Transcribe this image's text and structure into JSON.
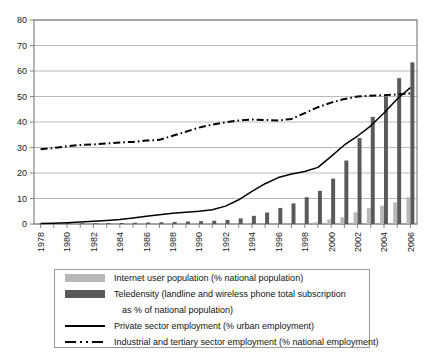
{
  "chart_data": {
    "type": "bar",
    "title": "",
    "subtitle": "",
    "xlabel": "",
    "ylabel": "",
    "ylim": [
      0,
      80
    ],
    "ytick_step": 10,
    "yticks": [
      0,
      10,
      20,
      30,
      40,
      50,
      60,
      70,
      80
    ],
    "grid": true,
    "legend_position": "below-plot",
    "x": [
      1978,
      1979,
      1980,
      1981,
      1982,
      1983,
      1984,
      1985,
      1986,
      1987,
      1988,
      1989,
      1990,
      1991,
      1992,
      1993,
      1994,
      1995,
      1996,
      1997,
      1998,
      1999,
      2000,
      2001,
      2002,
      2003,
      2004,
      2005,
      2006
    ],
    "xtick_labels": [
      "1978",
      "1980",
      "1982",
      "1984",
      "1986",
      "1988",
      "1990",
      "1992",
      "1994",
      "1996",
      "1998",
      "2000",
      "2002",
      "2004",
      "2006"
    ],
    "series": [
      {
        "name": "Internet user population (% national population)",
        "type": "bar",
        "color": "#b8b8b8",
        "values": [
          0,
          0,
          0,
          0,
          0,
          0,
          0,
          0,
          0,
          0,
          0,
          0,
          0,
          0,
          0,
          0,
          0,
          0,
          0,
          0,
          0.1,
          0.7,
          1.8,
          2.6,
          4.6,
          6.2,
          7.2,
          8.5,
          10.5
        ]
      },
      {
        "name": "Teledensity (landline and wireless phone total subscription as % of national population)",
        "type": "bar",
        "color": "#5a5a5a",
        "values": [
          0.2,
          0.2,
          0.3,
          0.3,
          0.3,
          0.4,
          0.4,
          0.5,
          0.6,
          0.7,
          0.8,
          1.0,
          1.1,
          1.3,
          1.6,
          2.2,
          3.2,
          4.5,
          6.3,
          8.1,
          10.5,
          13.0,
          17.8,
          24.9,
          33.7,
          42.0,
          50.0,
          57.2,
          63.4
        ]
      },
      {
        "name": "Private sector employment (% urban employment)",
        "type": "line",
        "style": "solid",
        "color": "#000000",
        "values": [
          0.2,
          0.3,
          0.5,
          0.8,
          1.1,
          1.4,
          1.8,
          2.4,
          3.0,
          3.6,
          4.2,
          4.6,
          5.0,
          5.6,
          7.0,
          9.5,
          12.8,
          15.8,
          18.2,
          19.6,
          20.6,
          22.2,
          26.5,
          31.0,
          34.5,
          38.5,
          43.5,
          49.0,
          53.5
        ]
      },
      {
        "name": "Industrial and tertiary sector employment (% national employment)",
        "type": "line",
        "style": "dash-dot",
        "color": "#000000",
        "values": [
          29.3,
          29.8,
          30.5,
          31.0,
          31.2,
          31.6,
          32.0,
          32.2,
          32.7,
          33.0,
          34.6,
          36.2,
          37.8,
          39.0,
          39.9,
          40.6,
          41.0,
          40.8,
          40.6,
          41.2,
          43.5,
          45.8,
          47.6,
          49.0,
          50.0,
          50.3,
          50.5,
          50.8,
          51.2
        ]
      }
    ]
  },
  "legend": {
    "rows": [
      {
        "key": "swatch-light",
        "label": "Internet user population (% national population)"
      },
      {
        "key": "swatch-dark",
        "label": "Teledensity (landline and wireless phone total subscription"
      },
      {
        "key": "none",
        "label": "as % of national population)"
      },
      {
        "key": "line-solid",
        "label": "Private sector employment (% urban employment)"
      },
      {
        "key": "line-dashdot",
        "label": "Industrial and tertiary sector employment (% national employment)"
      }
    ]
  },
  "colors": {
    "internet_bar": "#b8b8b8",
    "teledensity_bar": "#5a5a5a",
    "line": "#000000",
    "grid": "#aaaaaa",
    "axis": "#777777",
    "legend_border": "#9a9a9a"
  }
}
